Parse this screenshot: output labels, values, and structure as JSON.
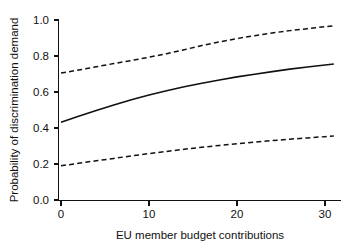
{
  "chart_data": {
    "type": "line",
    "title": "",
    "xlabel": "EU member budget contributions",
    "ylabel": "Probability of discrimination demand",
    "xlim": [
      -0.5,
      32.0
    ],
    "ylim": [
      0.0,
      1.0
    ],
    "xticks": [
      0,
      10,
      20,
      30
    ],
    "xticklabels": [
      "0",
      "10",
      "20",
      "30"
    ],
    "yticks": [
      0.0,
      0.2,
      0.4,
      0.6,
      0.8,
      1.0
    ],
    "yticklabels": [
      "0.0",
      "0.2",
      "0.4",
      "0.6",
      "0.8",
      "1.0"
    ],
    "grid": false,
    "legend": "none",
    "x": [
      0,
      2,
      4,
      6,
      8,
      10,
      12,
      14,
      16,
      18,
      20,
      22,
      24,
      26,
      28,
      30,
      31
    ],
    "series": [
      {
        "name": "Upper 95% confidence bound",
        "style": "dashed",
        "color": "#111111",
        "values": [
          0.705,
          0.722,
          0.74,
          0.758,
          0.775,
          0.793,
          0.813,
          0.835,
          0.858,
          0.878,
          0.897,
          0.913,
          0.928,
          0.941,
          0.952,
          0.963,
          0.968
        ]
      },
      {
        "name": "Predicted probability",
        "style": "solid",
        "color": "#111111",
        "values": [
          0.432,
          0.465,
          0.497,
          0.528,
          0.557,
          0.583,
          0.607,
          0.629,
          0.649,
          0.667,
          0.684,
          0.699,
          0.713,
          0.727,
          0.739,
          0.75,
          0.756
        ]
      },
      {
        "name": "Lower 95% confidence bound",
        "style": "dashed",
        "color": "#111111",
        "values": [
          0.19,
          0.204,
          0.218,
          0.231,
          0.245,
          0.258,
          0.27,
          0.282,
          0.293,
          0.303,
          0.313,
          0.322,
          0.33,
          0.338,
          0.345,
          0.352,
          0.355
        ]
      }
    ]
  },
  "axes": {
    "x_title": "EU member budget contributions",
    "y_title": "Probability of discrimination demand"
  }
}
